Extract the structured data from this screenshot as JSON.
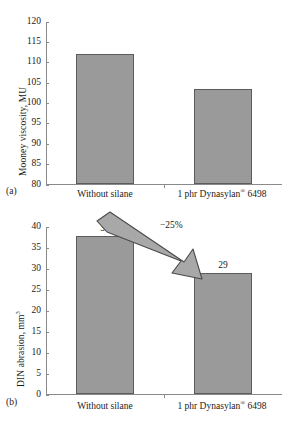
{
  "figure": {
    "panels": [
      {
        "tag": "(a)",
        "chart_data": {
          "type": "bar",
          "title": "",
          "xlabel": "",
          "ylabel": "Mooney viscosity, MU",
          "ylabel_main": "Mooney viscosity, MU",
          "ylabel_sup": "",
          "categories": [
            "Without silane",
            "1 phr Dynasylan® 6498"
          ],
          "values": [
            111.8,
            103.4
          ],
          "value_labels": [
            "",
            ""
          ],
          "ylim": [
            80,
            120
          ],
          "yticks": [
            80,
            85,
            90,
            95,
            100,
            105,
            110,
            115,
            120
          ],
          "ytick_labels": [
            "80",
            "85",
            "90",
            "95",
            "100",
            "105",
            "110",
            "115",
            "120"
          ],
          "grid": false,
          "legend": "none",
          "bar_color": "#9a9a9a",
          "bar_edge_color": "#5c5c5c"
        },
        "annotations": []
      },
      {
        "tag": "(b)",
        "chart_data": {
          "type": "bar",
          "title": "",
          "xlabel": "",
          "ylabel": "DIN abrasion, mm3",
          "ylabel_main": "DIN abrasion, mm",
          "ylabel_sup": "3",
          "categories": [
            "Without silane",
            "1 phr Dynasylan® 6498"
          ],
          "values": [
            37.7,
            28.7
          ],
          "value_labels": [
            "38",
            "29"
          ],
          "ylim": [
            0,
            40
          ],
          "yticks": [
            0,
            5,
            10,
            15,
            20,
            25,
            30,
            35,
            40
          ],
          "ytick_labels": [
            "0",
            "5",
            "10",
            "15",
            "20",
            "25",
            "30",
            "35",
            "40"
          ],
          "grid": false,
          "legend": "none",
          "bar_color": "#9a9a9a",
          "bar_edge_color": "#5c5c5c"
        },
        "annotations": [
          {
            "name": "decrease-arrow-label",
            "text": "−25%"
          }
        ]
      }
    ],
    "category_label_parts": [
      {
        "main": "Without silane",
        "sup": ""
      },
      {
        "main": "1 phr Dynasylan",
        "sup": "®",
        "tail": " 6498"
      }
    ]
  },
  "colors": {
    "bar_fill": "#9a9a9a",
    "bar_edge": "#5c5c5c",
    "axis": "#8a8a8a",
    "arrow_fill": "#a8a8a8",
    "arrow_edge": "#4a4a4a",
    "text": "#1a1a1a",
    "background": "#ffffff"
  }
}
